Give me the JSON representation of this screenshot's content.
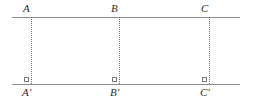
{
  "figure": {
    "background_color": "#ffffff",
    "line_color": "#8d8d8d",
    "dotted_color": "#6f6f6f",
    "label_color": "#2e2e2e",
    "top_line": {
      "label": "upper-line",
      "y": 17,
      "x_start": 12,
      "x_end": 240
    },
    "bottom_line": {
      "label": "lower-line",
      "y": 84,
      "x_start": 12,
      "x_end": 240
    },
    "points": [
      {
        "id": "A",
        "label": "A",
        "x": 31,
        "y": 17
      },
      {
        "id": "B",
        "label": "B",
        "x": 119,
        "y": 17
      },
      {
        "id": "C",
        "label": "C",
        "x": 209,
        "y": 17
      }
    ],
    "feet": [
      {
        "id": "A-prime",
        "label": "A′",
        "x": 31,
        "y": 84
      },
      {
        "id": "B-prime",
        "label": "B′",
        "x": 119,
        "y": 84
      },
      {
        "id": "C-prime",
        "label": "C′",
        "x": 209,
        "y": 84
      }
    ],
    "perpendiculars": [
      {
        "id": "AA-prime",
        "from": "A",
        "to": "A′",
        "x": 31,
        "style": "dotted"
      },
      {
        "id": "BB-prime",
        "from": "B",
        "to": "B′",
        "x": 119,
        "style": "dotted"
      },
      {
        "id": "CC-prime",
        "from": "C",
        "to": "C′",
        "x": 209,
        "style": "dotted"
      }
    ],
    "right_angle_marks": [
      {
        "id": "right-angle-A",
        "at": "A′",
        "x": 24,
        "y": 77
      },
      {
        "id": "right-angle-B",
        "at": "B′",
        "x": 112,
        "y": 77
      },
      {
        "id": "right-angle-C",
        "at": "C′",
        "x": 202,
        "y": 77
      }
    ]
  }
}
